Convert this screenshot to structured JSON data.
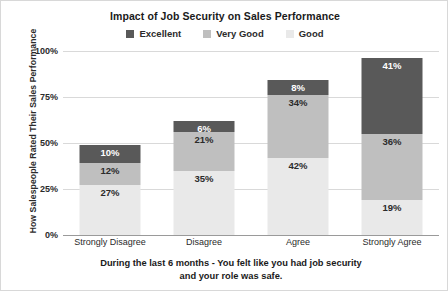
{
  "chart_data": {
    "type": "bar",
    "subtype": "stacked-bar-100",
    "title": "Impact of Job Security on Sales Performance",
    "xlabel": "During the last 6 months - You felt like you had job security and your role was safe.",
    "ylabel": "How Salespeople Rated Their Sales Performance",
    "categories": [
      "Strongly Disagree",
      "Disagree",
      "Agree",
      "Strongly Agree"
    ],
    "series": [
      {
        "name": "Good",
        "color": "#e9e9e9",
        "label_color": "#2b2b2b",
        "values": [
          27,
          35,
          42,
          19
        ]
      },
      {
        "name": "Very Good",
        "color": "#bfbfbf",
        "label_color": "#2b2b2b",
        "values": [
          12,
          21,
          34,
          36
        ]
      },
      {
        "name": "Excellent",
        "color": "#595959",
        "label_color": "#ffffff",
        "values": [
          10,
          6,
          8,
          41
        ]
      }
    ],
    "value_labels": [
      [
        "27%",
        "35%",
        "42%",
        "19%"
      ],
      [
        "12%",
        "21%",
        "34%",
        "36%"
      ],
      [
        "10%",
        "6%",
        "8%",
        "41%"
      ]
    ],
    "ylim": [
      0,
      100
    ],
    "yticks": [
      0,
      25,
      50,
      75,
      100
    ],
    "ytick_labels": [
      "0%",
      "25%",
      "50%",
      "75%",
      "100%"
    ],
    "grid": true,
    "legend_position": "top",
    "legend_order": [
      "Excellent",
      "Very Good",
      "Good"
    ]
  },
  "legend": {
    "items": [
      {
        "label": "Excellent",
        "color": "#595959"
      },
      {
        "label": "Very Good",
        "color": "#bfbfbf"
      },
      {
        "label": "Good",
        "color": "#e9e9e9"
      }
    ]
  },
  "x_axis": {
    "title_line_1": "During the last 6 months - You felt like you had job security",
    "title_line_2": "and your role was safe."
  }
}
